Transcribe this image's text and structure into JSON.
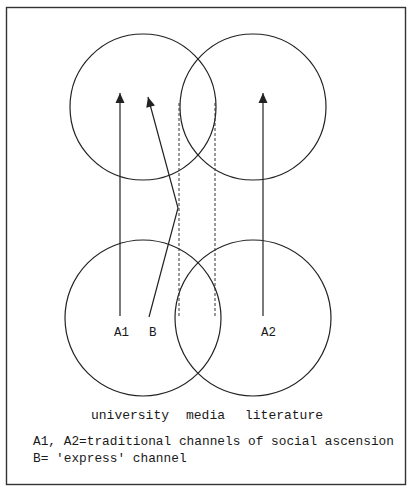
{
  "diagram": {
    "colors": {
      "stroke": "#222222",
      "background": "#ffffff",
      "frame": "#333333"
    },
    "circles": [
      {
        "id": "top-left",
        "cx": 143,
        "cy": 107,
        "r": 73
      },
      {
        "id": "top-right",
        "cx": 253,
        "cy": 107,
        "r": 73
      },
      {
        "id": "bottom-left",
        "cx": 143,
        "cy": 318,
        "r": 78
      },
      {
        "id": "bottom-right",
        "cx": 253,
        "cy": 318,
        "r": 78
      }
    ],
    "nodes": {
      "a1": "A1",
      "b": "B",
      "a2": "A2"
    },
    "channels": [
      {
        "id": "A1",
        "type": "arrow",
        "points": [
          [
            120,
            316
          ],
          [
            120,
            93
          ]
        ]
      },
      {
        "id": "B",
        "type": "arrow",
        "points": [
          [
            149,
            317
          ],
          [
            178,
            208
          ],
          [
            148,
            97
          ]
        ]
      },
      {
        "id": "A2",
        "type": "arrow",
        "points": [
          [
            263,
            316
          ],
          [
            263,
            93
          ]
        ]
      }
    ],
    "dashed_guides": [
      {
        "x": 179,
        "y1": 103,
        "y2": 316
      },
      {
        "x": 215,
        "y1": 103,
        "y2": 316
      }
    ],
    "categories": {
      "university": "university",
      "media": "media",
      "literature": "literature"
    },
    "legend": {
      "line1": "A1, A2=traditional channels of social ascension",
      "line2": "B= 'express' channel"
    }
  }
}
